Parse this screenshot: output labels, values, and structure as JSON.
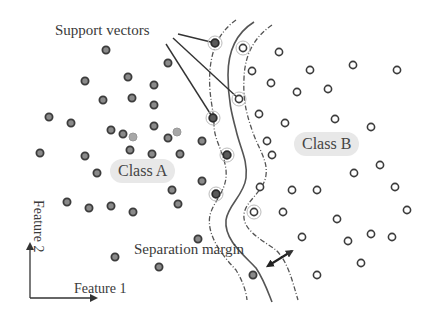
{
  "labels": {
    "support_vectors": "Support vectors",
    "class_a": "Class A",
    "class_b": "Class B",
    "separation_margin": "Separation margin",
    "x_axis": "Feature 1",
    "y_axis": "Feature 2"
  },
  "colors": {
    "class_a_fill": "#8a8a8a",
    "class_a_stroke": "#3c3c3c",
    "class_a_light_fill": "#a8a8a8",
    "class_b_stroke": "#3c3c3c",
    "class_b_fill": "#ffffff",
    "boundary": "#555555",
    "margin": "#555555",
    "label_bg": "#e8e8e8",
    "text": "#3a3a3a"
  },
  "class_a_points": [
    [
      106,
      50
    ],
    [
      168,
      63
    ],
    [
      85,
      81
    ],
    [
      128,
      77
    ],
    [
      154,
      85
    ],
    [
      103,
      100
    ],
    [
      132,
      98
    ],
    [
      154,
      105
    ],
    [
      49,
      117
    ],
    [
      71,
      123
    ],
    [
      111,
      130
    ],
    [
      123,
      134
    ],
    [
      154,
      126
    ],
    [
      168,
      138
    ],
    [
      202,
      141
    ],
    [
      40,
      153
    ],
    [
      85,
      156
    ],
    [
      130,
      150
    ],
    [
      152,
      154
    ],
    [
      180,
      154
    ],
    [
      97,
      173
    ],
    [
      202,
      181
    ],
    [
      172,
      190
    ],
    [
      67,
      202
    ],
    [
      89,
      208
    ],
    [
      111,
      206
    ],
    [
      133,
      212
    ],
    [
      178,
      204
    ],
    [
      198,
      239
    ],
    [
      115,
      257
    ],
    [
      159,
      267
    ],
    [
      253,
      275
    ]
  ],
  "class_a_light_points": [
    [
      133,
      137
    ],
    [
      177,
      132
    ]
  ],
  "class_a_support_vectors": [
    [
      215,
      43
    ],
    [
      213,
      118
    ],
    [
      227,
      155
    ],
    [
      216,
      194
    ]
  ],
  "class_b_points": [
    [
      279,
      52
    ],
    [
      252,
      71
    ],
    [
      310,
      70
    ],
    [
      353,
      65
    ],
    [
      397,
      70
    ],
    [
      271,
      83
    ],
    [
      297,
      92
    ],
    [
      328,
      89
    ],
    [
      259,
      114
    ],
    [
      285,
      123
    ],
    [
      335,
      119
    ],
    [
      371,
      127
    ],
    [
      267,
      141
    ],
    [
      272,
      155
    ],
    [
      260,
      187
    ],
    [
      292,
      190
    ],
    [
      317,
      190
    ],
    [
      354,
      173
    ],
    [
      380,
      165
    ],
    [
      395,
      187
    ],
    [
      407,
      210
    ],
    [
      283,
      212
    ],
    [
      337,
      219
    ],
    [
      302,
      237
    ],
    [
      348,
      241
    ],
    [
      371,
      234
    ],
    [
      392,
      237
    ],
    [
      361,
      263
    ],
    [
      317,
      275
    ]
  ],
  "class_b_support_vectors": [
    [
      243,
      48
    ],
    [
      239,
      99
    ],
    [
      254,
      212
    ]
  ]
}
